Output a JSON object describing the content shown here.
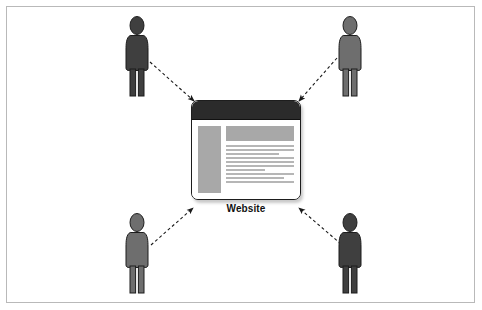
{
  "diagram": {
    "background_color": "#ffffff",
    "border_color": "#b9b9b9"
  },
  "center_node": {
    "label": "Website",
    "type": "browser-window",
    "titlebar_color": "#2b2b2b",
    "panel_color": "#a8a8a8",
    "line_color": "#b6b6b6",
    "border_color": "#1d1d1d",
    "content": {
      "sidebar": true,
      "header_block": true,
      "text_line_widths": [
        100,
        100,
        78,
        100,
        100,
        100,
        58,
        100,
        86,
        100
      ]
    }
  },
  "actors": [
    {
      "name": "visitor-top-left",
      "position": "top-left",
      "color": "#3f3f3f",
      "x": 120,
      "y": 16
    },
    {
      "name": "visitor-top-right",
      "position": "top-right",
      "color": "#6e6e6e",
      "x": 333,
      "y": 16
    },
    {
      "name": "visitor-bottom-left",
      "position": "bottom-left",
      "color": "#6e6e6e",
      "x": 120,
      "y": 213
    },
    {
      "name": "visitor-bottom-right",
      "position": "bottom-right",
      "color": "#3f3f3f",
      "x": 333,
      "y": 213
    }
  ],
  "connections": [
    {
      "name": "arrow-top-left-to-website",
      "from": "visitor-top-left",
      "to": "center_node",
      "style": "dashed",
      "color": "#1a1a1a",
      "x1": 150,
      "y1": 62,
      "x2": 196,
      "y2": 103
    },
    {
      "name": "arrow-top-right-to-website",
      "from": "visitor-top-right",
      "to": "center_node",
      "style": "dashed",
      "color": "#1a1a1a",
      "x1": 336,
      "y1": 58,
      "x2": 297,
      "y2": 102
    },
    {
      "name": "arrow-bottom-left-to-website",
      "from": "visitor-bottom-left",
      "to": "center_node",
      "style": "dashed",
      "color": "#1a1a1a",
      "x1": 151,
      "y1": 244,
      "x2": 194,
      "y2": 206
    },
    {
      "name": "arrow-bottom-right-to-website",
      "from": "visitor-bottom-right",
      "to": "center_node",
      "style": "dashed",
      "color": "#1a1a1a",
      "x1": 340,
      "y1": 243,
      "x2": 296,
      "y2": 206
    }
  ]
}
